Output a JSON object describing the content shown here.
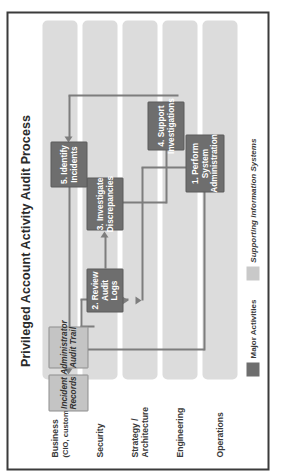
{
  "diagram": {
    "title": "Privileged Account Activity Audit Process",
    "orientation_note": "rotated-90-ccw",
    "colors": {
      "frame_border": "#3b3b3b",
      "lane_band": "#dcdcdc",
      "activity_fill": "#6e6e6e",
      "activity_text": "#ffffff",
      "system_fill": "#c4c4c4",
      "system_border": "#8d8d8d",
      "connector": "#7d7d7d",
      "background": "#ffffff"
    },
    "lanes": [
      {
        "name": "Business",
        "sub": "(CIO, customers)"
      },
      {
        "name": "Security",
        "sub": ""
      },
      {
        "name": "Strategy /",
        "sub": "Architecture"
      },
      {
        "name": "Engineering",
        "sub": ""
      },
      {
        "name": "Operations",
        "sub": ""
      }
    ],
    "legend": [
      {
        "label": "Major Activities",
        "swatch": "#6e6e6e",
        "style": "bold"
      },
      {
        "label": "Supporting Information Systems",
        "swatch": "#c9c9c9",
        "style": "bold-italic"
      }
    ],
    "nodes": {
      "perform_system_administration": {
        "label": "1. Perform System\nAdministration",
        "line1": "1. Perform System",
        "line2": "Administration",
        "type": "activity",
        "lane": "Operations"
      },
      "review_audit_logs": {
        "label": "2. Review\nAudit Logs",
        "line1": "2. Review",
        "line2": "Audit Logs",
        "type": "activity",
        "lane": "Security"
      },
      "investigate_discrepancies": {
        "label": "3. Investigate\nDiscrepancies",
        "line1": "3. Investigate",
        "line2": "Discrepancies",
        "type": "activity",
        "lane": "Security"
      },
      "support_investigations": {
        "label": "4. Support\nInvestigations",
        "line1": "4. Support",
        "line2": "Investigations",
        "type": "activity",
        "lane": "Operations"
      },
      "identify_incidents": {
        "label": "5. Identify\nIncidents",
        "line1": "5. Identify",
        "line2": "Incidents",
        "type": "activity",
        "lane": "Security"
      },
      "administrator_audit_trail": {
        "label": "Administrator\nAudit Trail",
        "line1": "Administrator",
        "line2": "Audit Trail",
        "type": "system",
        "lane": "Business"
      },
      "incident_records": {
        "label": "Incident\nRecords",
        "line1": "Incident",
        "line2": "Records",
        "type": "system",
        "lane": "Business"
      }
    },
    "flows": [
      {
        "from": "perform_system_administration",
        "to": "administrator_audit_trail"
      },
      {
        "from": "perform_system_administration",
        "to": "review_audit_logs"
      },
      {
        "from": "administrator_audit_trail",
        "to": "review_audit_logs"
      },
      {
        "from": "review_audit_logs",
        "to": "investigate_discrepancies"
      },
      {
        "from": "investigate_discrepancies",
        "to": "support_investigations"
      },
      {
        "from": "support_investigations",
        "to": "identify_incidents"
      },
      {
        "from": "identify_incidents",
        "to": "incident_records"
      }
    ]
  }
}
